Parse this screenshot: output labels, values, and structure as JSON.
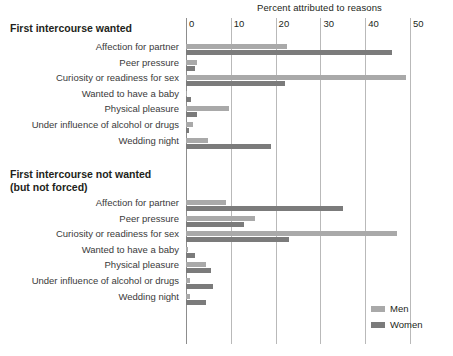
{
  "chart_data": {
    "type": "bar",
    "orientation": "horizontal",
    "title": "Percent attributed to reasons",
    "xlabel": "Percent attributed to reasons",
    "ylabel": "",
    "xlim": [
      0,
      60
    ],
    "xticks": [
      0,
      10,
      20,
      30,
      40,
      50,
      60
    ],
    "xticklabels": [
      "0",
      "10",
      "20",
      "30",
      "40",
      "50",
      "60"
    ],
    "grid": true,
    "legend": {
      "position": "bottom-right",
      "entries": [
        {
          "name": "Men",
          "color": "#a9a9a9"
        },
        {
          "name": "Women",
          "color": "#7b7b7b"
        }
      ]
    },
    "panels": [
      {
        "title": "First intercourse wanted",
        "categories": [
          "Affection for partner",
          "Peer pressure",
          "Curiosity or readiness for sex",
          "Wanted to have a baby",
          "Physical pleasure",
          "Under influence of alcohol or drugs",
          "Wedding night"
        ],
        "series": [
          {
            "name": "Men",
            "color": "#a9a9a9",
            "values": [
              22.5,
              2.5,
              49.0,
              0.3,
              9.5,
              1.5,
              5.0
            ]
          },
          {
            "name": "Women",
            "color": "#7b7b7b",
            "values": [
              46.0,
              2.0,
              22.0,
              1.2,
              2.5,
              0.6,
              19.0
            ]
          }
        ]
      },
      {
        "title": "First intercourse not wanted\n(but not forced)",
        "categories": [
          "Affection for partner",
          "Peer pressure",
          "Curiosity or readiness for sex",
          "Wanted to have a baby",
          "Physical pleasure",
          "Under influence of alcohol or drugs",
          "Wedding night"
        ],
        "series": [
          {
            "name": "Men",
            "color": "#a9a9a9",
            "values": [
              9.0,
              15.5,
              47.0,
              0.4,
              4.5,
              1.0,
              1.0
            ]
          },
          {
            "name": "Women",
            "color": "#7b7b7b",
            "values": [
              35.0,
              13.0,
              23.0,
              2.0,
              5.5,
              6.0,
              4.5
            ]
          }
        ]
      }
    ]
  },
  "legend": {
    "men": "Men",
    "women": "Women"
  }
}
